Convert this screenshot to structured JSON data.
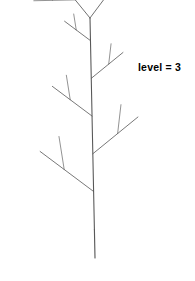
{
  "figure": {
    "background_color": "#ffffff",
    "stroke_color": "#585858",
    "label": {
      "text": "level = 3",
      "color": "#000000",
      "x": 138,
      "y": 61,
      "bold": true
    }
  },
  "chart_data": {
    "type": "diagram",
    "title": "level = 3",
    "recursion_level": 3,
    "trunk": {
      "base_x": 95,
      "base_y": 258,
      "apex_x": 90,
      "apex_y": 18,
      "length": 240
    },
    "bounds": {
      "left": 19,
      "right": 152,
      "top": 18,
      "bottom": 258
    },
    "parameters": {
      "branch_angle_deg": 38,
      "child_scale": 0.62,
      "side_twig_angle_deg": 52,
      "side_twig_scale": 0.34,
      "twigs_per_limb": 5,
      "stroke_width": 0.9
    },
    "grid": false,
    "legend": false,
    "xlabel": "",
    "ylabel": ""
  }
}
